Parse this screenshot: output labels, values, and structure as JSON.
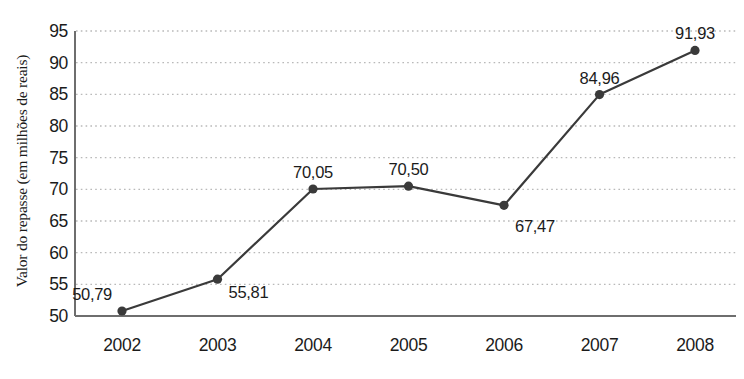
{
  "chart_data": {
    "type": "line",
    "title": "",
    "xlabel": "",
    "ylabel": "Valor do repasse (em milhões de reais)",
    "categories": [
      "2002",
      "2003",
      "2004",
      "2005",
      "2006",
      "2007",
      "2008"
    ],
    "values": [
      50.79,
      55.81,
      70.05,
      70.5,
      67.47,
      84.96,
      91.93
    ],
    "value_labels": [
      "50,79",
      "55,81",
      "70,05",
      "70,50",
      "67,47",
      "84,96",
      "91,93"
    ],
    "ylim": [
      50,
      95
    ],
    "ytick_labels": [
      "95",
      "90",
      "85",
      "80",
      "75",
      "70",
      "65",
      "60",
      "55",
      "50"
    ],
    "ytick_values": [
      95,
      90,
      85,
      80,
      75,
      70,
      65,
      60,
      55,
      50
    ],
    "grid": true,
    "grid_style": "dotted-horizontal",
    "legend": false,
    "series": [
      {
        "name": "Valor do repasse",
        "values": [
          50.79,
          55.81,
          70.05,
          70.5,
          67.47,
          84.96,
          91.93
        ],
        "color": "#3a3a3a",
        "marker": "circle"
      }
    ]
  },
  "colors": {
    "line": "#3a3a3a",
    "marker": "#3a3a3a",
    "axis": "#6e6e6e",
    "grid": "#b9b9b9",
    "text": "#1b1b1b",
    "background": "#ffffff"
  },
  "footnote": {
    "text": ""
  }
}
